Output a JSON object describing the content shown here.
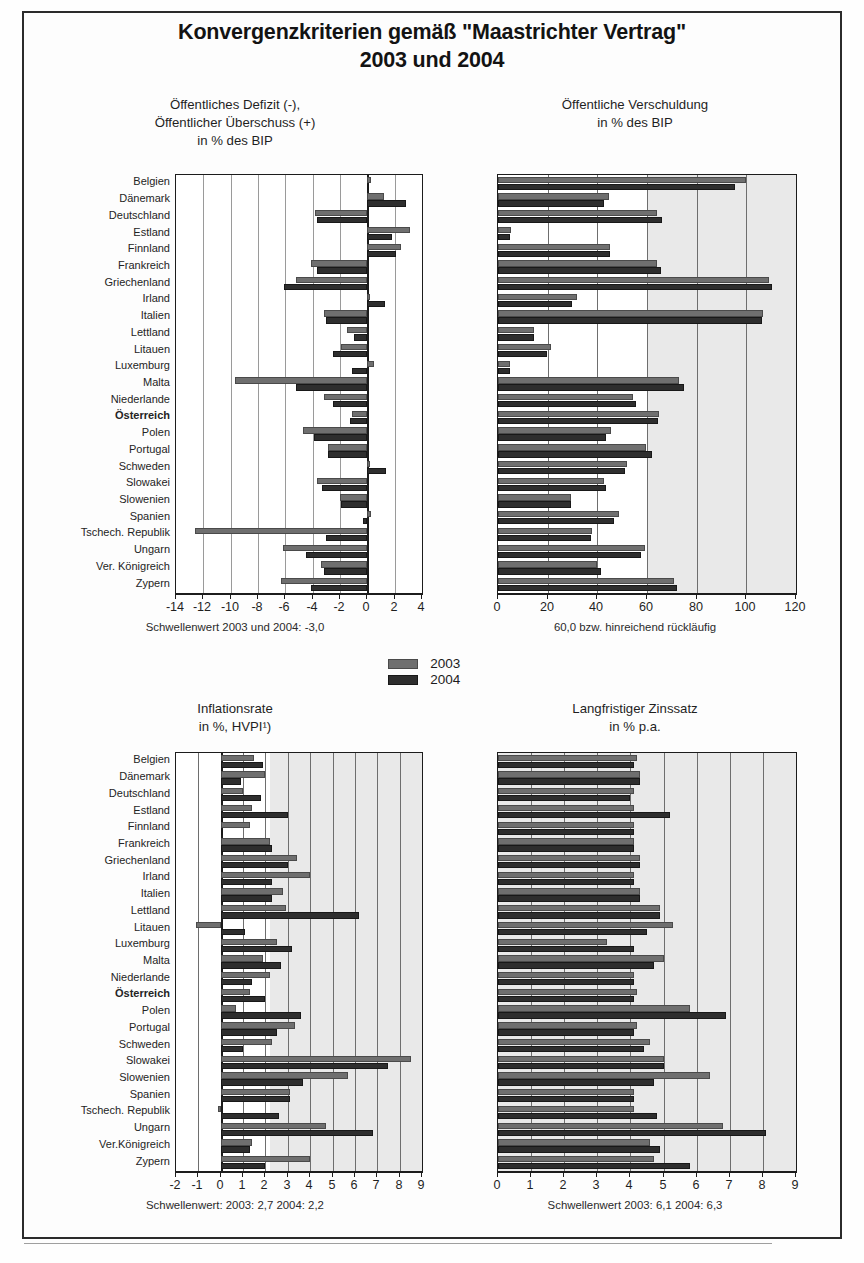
{
  "header": {
    "title_line1": "Konvergenzkriterien gemäß \"Maastrichter Vertrag\"",
    "title_line2": "2003 und 2004"
  },
  "legend": {
    "entries": [
      {
        "label": "2003",
        "color": "#6f6f6f",
        "swatch": "legend-swatch-2003"
      },
      {
        "label": "2004",
        "color": "#2e2e2e",
        "swatch": "legend-swatch-2004"
      }
    ]
  },
  "countries": [
    "Belgien",
    "Dänemark",
    "Deutschland",
    "Estland",
    "Finnland",
    "Frankreich",
    "Griechenland",
    "Irland",
    "Italien",
    "Lettland",
    "Litauen",
    "Luxemburg",
    "Malta",
    "Niederlande",
    "Österreich",
    "Polen",
    "Portugal",
    "Schweden",
    "Slowakei",
    "Slowenien",
    "Spanien",
    "Tschech. Republik",
    "Ungarn",
    "Ver. Königreich",
    "Zypern"
  ],
  "countries_bottom": [
    "Belgien",
    "Dänemark",
    "Deutschland",
    "Estland",
    "Finnland",
    "Frankreich",
    "Griechenland",
    "Irland",
    "Italien",
    "Lettland",
    "Litauen",
    "Luxemburg",
    "Malta",
    "Niederlande",
    "Österreich",
    "Polen",
    "Portugal",
    "Schweden",
    "Slowakei",
    "Slowenien",
    "Spanien",
    "Tschech. Republik",
    "Ungarn",
    "Ver.Königreich",
    "Zypern"
  ],
  "highlight_country": "Österreich",
  "chart_data": [
    {
      "id": "deficit",
      "type": "bar",
      "orientation": "horizontal",
      "title": "Öffentliches Defizit (-),\nÖffentlicher Überschuss (+)\nin % des BIP",
      "title_lines": [
        "Öffentliches Defizit (-),",
        "Öffentlicher Überschuss (+)",
        "in % des BIP"
      ],
      "xlabel": "",
      "ylabel": "",
      "xlim": [
        -14,
        4
      ],
      "xticks": [
        -14,
        -12,
        -10,
        -8,
        -6,
        -4,
        -2,
        0,
        2,
        4
      ],
      "grid": true,
      "legend_position": "below-charts",
      "threshold_note": "Schwellenwert 2003 und 2004: -3,0",
      "categories": [
        "Belgien",
        "Dänemark",
        "Deutschland",
        "Estland",
        "Finnland",
        "Frankreich",
        "Griechenland",
        "Irland",
        "Italien",
        "Lettland",
        "Litauen",
        "Luxemburg",
        "Malta",
        "Niederlande",
        "Österreich",
        "Polen",
        "Portugal",
        "Schweden",
        "Slowakei",
        "Slowenien",
        "Spanien",
        "Tschech. Republik",
        "Ungarn",
        "Ver. Königreich",
        "Zypern"
      ],
      "series": [
        {
          "name": "2003",
          "values": [
            0.3,
            1.2,
            -3.8,
            3.1,
            2.5,
            -4.1,
            -5.2,
            0.2,
            -3.2,
            -1.5,
            -1.9,
            0.5,
            -9.7,
            -3.2,
            -1.1,
            -4.7,
            -2.9,
            0.2,
            -3.7,
            -2.0,
            0.3,
            -12.6,
            -6.2,
            -3.4,
            -6.3
          ]
        },
        {
          "name": "2004",
          "values": [
            0.0,
            2.8,
            -3.7,
            1.8,
            2.1,
            -3.7,
            -6.1,
            1.3,
            -3.0,
            -1.0,
            -2.5,
            -1.1,
            -5.2,
            -2.5,
            -1.3,
            -3.9,
            -2.9,
            1.4,
            -3.3,
            -1.9,
            -0.3,
            -3.0,
            -4.5,
            -3.2,
            -4.1
          ]
        }
      ]
    },
    {
      "id": "debt",
      "type": "bar",
      "orientation": "horizontal",
      "title": "Öffentliche Verschuldung\nin % des BIP",
      "title_lines": [
        "Öffentliche Verschuldung",
        "in % des BIP"
      ],
      "xlim": [
        0,
        120
      ],
      "xticks": [
        0,
        20,
        40,
        60,
        80,
        100,
        120
      ],
      "grid": true,
      "threshold_note": "60,0 bzw. hinreichend rückläufig",
      "categories": [
        "Belgien",
        "Dänemark",
        "Deutschland",
        "Estland",
        "Finnland",
        "Frankreich",
        "Griechenland",
        "Irland",
        "Italien",
        "Lettland",
        "Litauen",
        "Luxemburg",
        "Malta",
        "Niederlande",
        "Österreich",
        "Polen",
        "Portugal",
        "Schweden",
        "Slowakei",
        "Slowenien",
        "Spanien",
        "Tschech. Republik",
        "Ungarn",
        "Ver. Königreich",
        "Zypern"
      ],
      "series": [
        {
          "name": "2003",
          "values": [
            100.0,
            44.7,
            64.2,
            5.3,
            45.3,
            63.9,
            109.3,
            32.0,
            106.8,
            14.4,
            21.4,
            4.9,
            72.8,
            54.3,
            65.0,
            45.4,
            59.4,
            52.0,
            42.6,
            29.4,
            48.9,
            37.8,
            59.1,
            39.7,
            70.9
          ]
        },
        {
          "name": "2004",
          "values": [
            95.6,
            42.7,
            66.0,
            4.9,
            45.1,
            65.6,
            110.5,
            29.8,
            106.5,
            14.4,
            19.6,
            4.9,
            75.0,
            55.7,
            64.3,
            43.6,
            61.9,
            51.2,
            43.6,
            29.4,
            46.9,
            37.4,
            57.4,
            41.6,
            71.9
          ]
        }
      ]
    },
    {
      "id": "inflation",
      "type": "bar",
      "orientation": "horizontal",
      "title": "Inflationsrate\nin %, HVPI¹)",
      "title_lines": [
        "Inflationsrate",
        "in %, HVPI¹)"
      ],
      "xlim": [
        -2,
        9
      ],
      "xticks": [
        -2,
        -1,
        0,
        1,
        2,
        3,
        4,
        5,
        6,
        7,
        8,
        9
      ],
      "grid": true,
      "threshold_note": "Schwellenwert: 2003: 2,7  2004: 2,2",
      "categories": [
        "Belgien",
        "Dänemark",
        "Deutschland",
        "Estland",
        "Finnland",
        "Frankreich",
        "Griechenland",
        "Irland",
        "Italien",
        "Lettland",
        "Litauen",
        "Luxemburg",
        "Malta",
        "Niederlande",
        "Österreich",
        "Polen",
        "Portugal",
        "Schweden",
        "Slowakei",
        "Slowenien",
        "Spanien",
        "Tschech. Republik",
        "Ungarn",
        "Ver.Königreich",
        "Zypern"
      ],
      "series": [
        {
          "name": "2003",
          "values": [
            1.5,
            2.0,
            1.0,
            1.4,
            1.3,
            2.2,
            3.4,
            4.0,
            2.8,
            2.9,
            -1.1,
            2.5,
            1.9,
            2.2,
            1.3,
            0.7,
            3.3,
            2.3,
            8.5,
            5.7,
            3.1,
            -0.1,
            4.7,
            1.4,
            4.0
          ]
        },
        {
          "name": "2004",
          "values": [
            1.9,
            0.9,
            1.8,
            3.0,
            0.1,
            2.3,
            3.0,
            2.3,
            2.3,
            6.2,
            1.1,
            3.2,
            2.7,
            1.4,
            2.0,
            3.6,
            2.5,
            1.0,
            7.5,
            3.7,
            3.1,
            2.6,
            6.8,
            1.3,
            2.0
          ]
        }
      ]
    },
    {
      "id": "interest",
      "type": "bar",
      "orientation": "horizontal",
      "title": "Langfristiger Zinssatz\nin % p.a.",
      "title_lines": [
        "Langfristiger Zinssatz",
        "in % p.a."
      ],
      "xlim": [
        0,
        9
      ],
      "xticks": [
        0,
        1,
        2,
        3,
        4,
        5,
        6,
        7,
        8,
        9
      ],
      "grid": true,
      "threshold_note": "Schwellenwert 2003: 6,1  2004: 6,3",
      "categories": [
        "Belgien",
        "Dänemark",
        "Deutschland",
        "Estland",
        "Finnland",
        "Frankreich",
        "Griechenland",
        "Irland",
        "Italien",
        "Lettland",
        "Litauen",
        "Luxemburg",
        "Malta",
        "Niederlande",
        "Österreich",
        "Polen",
        "Portugal",
        "Schweden",
        "Slowakei",
        "Slowenien",
        "Spanien",
        "Tschech. Republik",
        "Ungarn",
        "Ver.Königreich",
        "Zypern"
      ],
      "series": [
        {
          "name": "2003",
          "values": [
            4.2,
            4.3,
            4.1,
            4.1,
            4.1,
            4.1,
            4.3,
            4.1,
            4.3,
            4.9,
            5.3,
            3.3,
            5.0,
            4.1,
            4.2,
            5.8,
            4.2,
            4.6,
            5.0,
            6.4,
            4.1,
            4.1,
            6.8,
            4.6,
            4.7
          ]
        },
        {
          "name": "2004",
          "values": [
            4.1,
            4.3,
            4.0,
            5.2,
            4.1,
            4.1,
            4.3,
            4.1,
            4.3,
            4.9,
            4.5,
            4.1,
            4.7,
            4.1,
            4.1,
            6.9,
            4.1,
            4.4,
            5.0,
            4.7,
            4.1,
            4.8,
            8.1,
            4.9,
            5.8
          ]
        }
      ]
    }
  ]
}
